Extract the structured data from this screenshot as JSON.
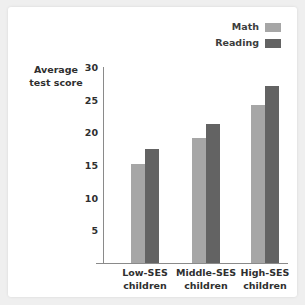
{
  "chart_data": {
    "type": "bar",
    "title": "",
    "subtitle": "",
    "xlabel": "",
    "ylabel": "Average test score",
    "ylabel_lines": [
      "Average",
      "test score"
    ],
    "categories": [
      "Low-SES children",
      "Middle-SES children",
      "High-SES children"
    ],
    "category_lines": [
      [
        "Low-SES",
        "children"
      ],
      [
        "Middle-SES",
        "children"
      ],
      [
        "High-SES",
        "children"
      ]
    ],
    "series": [
      {
        "name": "Math",
        "color": "#a6a6a6",
        "values": [
          15.2,
          19.2,
          24.2
        ]
      },
      {
        "name": "Reading",
        "color": "#636363",
        "values": [
          17.4,
          21.3,
          27.1
        ]
      }
    ],
    "ylim": [
      0,
      30
    ],
    "yticks": [
      5,
      10,
      15,
      20,
      25,
      30
    ],
    "ytick_labels": [
      "5",
      "10",
      "15",
      "20",
      "25",
      "30"
    ],
    "grid": false,
    "legend_position": "top-right",
    "axis_color": "#8a8a8a",
    "background": "#ffffff"
  },
  "legend": {
    "entries": [
      {
        "label": "Math",
        "color": "#a6a6a6"
      },
      {
        "label": "Reading",
        "color": "#636363"
      }
    ]
  }
}
